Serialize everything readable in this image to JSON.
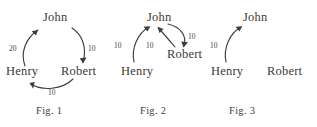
{
  "diagram": {
    "type": "directed-graph-series",
    "background_color": "#ffffff",
    "ink_color": "#3f3d3b",
    "nodes": [
      "John",
      "Henry",
      "Robert"
    ],
    "figures": [
      {
        "caption": "Fig. 1",
        "nodes": [
          {
            "id": "john",
            "label": "John"
          },
          {
            "id": "henry",
            "label": "Henry"
          },
          {
            "id": "robert",
            "label": "Robert"
          }
        ],
        "edges": [
          {
            "from": "Henry",
            "to": "John",
            "weight": "20"
          },
          {
            "from": "John",
            "to": "Robert",
            "weight": "10"
          },
          {
            "from": "Robert",
            "to": "Henry",
            "weight": "10"
          }
        ]
      },
      {
        "caption": "Fig. 2",
        "nodes": [
          {
            "id": "john",
            "label": "John"
          },
          {
            "id": "henry",
            "label": "Henry"
          },
          {
            "id": "robert",
            "label": "Robert"
          }
        ],
        "edges": [
          {
            "from": "Henry",
            "to": "John",
            "weight": "10"
          },
          {
            "from": "Robert",
            "to": "John",
            "weight": "10"
          },
          {
            "from": "John",
            "to": "Robert",
            "weight": "10"
          }
        ]
      },
      {
        "caption": "Fig. 3",
        "nodes": [
          {
            "id": "john",
            "label": "John"
          },
          {
            "id": "henry",
            "label": "Henry"
          },
          {
            "id": "robert",
            "label": "Robert"
          }
        ],
        "edges": [
          {
            "from": "Henry",
            "to": "John",
            "weight": "10"
          }
        ]
      }
    ]
  },
  "fig1": {
    "john": "John",
    "henry": "Henry",
    "robert": "Robert",
    "w_henry_john": "20",
    "w_john_robert": "10",
    "w_robert_henry": "10",
    "caption": "Fig. 1"
  },
  "fig2": {
    "john": "John",
    "henry": "Henry",
    "robert": "Robert",
    "w_henry_john": "10",
    "w_robert_john": "10",
    "w_john_robert": "10",
    "caption": "Fig. 2"
  },
  "fig3": {
    "john": "John",
    "henry": "Henry",
    "robert": "Robert",
    "w_henry_john": "10",
    "caption": "Fig. 3"
  }
}
